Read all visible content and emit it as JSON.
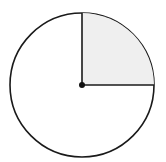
{
  "diagram": {
    "type": "circle-with-shaded-quadrant",
    "circle": {
      "cx": 82,
      "cy": 85,
      "r": 72,
      "stroke": "#1a1a1a",
      "fill": "#ffffff"
    },
    "shaded_sector": {
      "start_angle_deg": 0,
      "end_angle_deg": 90,
      "quadrant": "upper-right",
      "fill": "#efefef"
    },
    "center_point": {
      "cx": 82,
      "cy": 85,
      "r": 3,
      "fill": "#111111"
    },
    "radii": [
      {
        "to": "top",
        "x2": 82,
        "y2": 13
      },
      {
        "to": "right",
        "x2": 154,
        "y2": 85
      }
    ]
  }
}
